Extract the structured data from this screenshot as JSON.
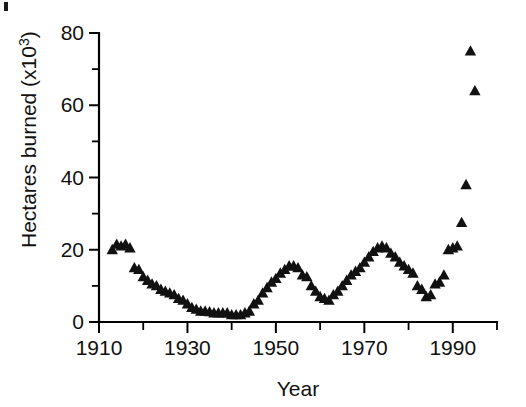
{
  "figure": {
    "background_color": "#ffffff",
    "marker_color": "#111111",
    "axis_color": "#000000"
  },
  "axes": {
    "y_label_main": "Hectares burned (x10",
    "y_label_exponent": "3",
    "y_label_close": ")",
    "x_label": "Year",
    "y_ticks": [
      "0",
      "20",
      "40",
      "60",
      "80"
    ],
    "x_ticks": [
      "1910",
      "1930",
      "1950",
      "1970",
      "1990"
    ]
  },
  "chart_data": {
    "type": "scatter",
    "title": "",
    "xlabel": "Year",
    "ylabel": "Hectares burned (x10^3)",
    "xlim": [
      1910,
      2000
    ],
    "ylim": [
      0,
      80
    ],
    "x_major_ticks": [
      1910,
      1930,
      1950,
      1970,
      1990
    ],
    "x_minor_ticks": [
      1920,
      1940,
      1960,
      1980,
      2000
    ],
    "y_major_ticks": [
      0,
      20,
      40,
      60,
      80
    ],
    "y_minor_ticks": [
      10,
      30,
      50,
      70
    ],
    "grid": false,
    "legend": "none",
    "marker": "triangle",
    "series": [
      {
        "name": "Hectares burned",
        "x": [
          1913,
          1914,
          1915,
          1916,
          1917,
          1918,
          1919,
          1920,
          1921,
          1922,
          1923,
          1924,
          1925,
          1926,
          1927,
          1928,
          1929,
          1930,
          1931,
          1932,
          1933,
          1934,
          1935,
          1936,
          1937,
          1938,
          1939,
          1940,
          1941,
          1942,
          1943,
          1944,
          1945,
          1946,
          1947,
          1948,
          1949,
          1950,
          1951,
          1952,
          1953,
          1954,
          1955,
          1956,
          1957,
          1958,
          1959,
          1960,
          1961,
          1962,
          1963,
          1964,
          1965,
          1966,
          1967,
          1968,
          1969,
          1970,
          1971,
          1972,
          1973,
          1974,
          1975,
          1976,
          1977,
          1978,
          1979,
          1980,
          1981,
          1982,
          1983,
          1984,
          1985,
          1986,
          1987,
          1988,
          1989,
          1990,
          1991,
          1992,
          1993,
          1994,
          1995
        ],
        "y": [
          20.0,
          21.5,
          21.0,
          21.5,
          20.5,
          15.0,
          14.5,
          12.5,
          11.5,
          10.5,
          10.0,
          9.0,
          8.5,
          8.0,
          7.5,
          6.5,
          6.0,
          5.0,
          4.0,
          3.5,
          3.0,
          3.0,
          2.8,
          2.5,
          2.5,
          2.5,
          2.5,
          2.0,
          2.0,
          2.0,
          2.5,
          3.0,
          5.0,
          6.0,
          8.0,
          9.5,
          11.0,
          12.0,
          13.5,
          14.5,
          15.5,
          15.5,
          15.0,
          13.0,
          12.5,
          10.0,
          8.5,
          7.0,
          6.5,
          6.0,
          7.5,
          8.5,
          10.0,
          11.5,
          13.0,
          14.0,
          15.0,
          16.5,
          18.0,
          19.5,
          20.5,
          21.0,
          20.5,
          19.0,
          18.0,
          16.5,
          15.5,
          14.5,
          13.5,
          10.0,
          9.0,
          7.0,
          7.5,
          10.5,
          11.0,
          13.0,
          20.0,
          20.5,
          21.0,
          27.5,
          38.0,
          75.0,
          64.0
        ]
      }
    ]
  }
}
